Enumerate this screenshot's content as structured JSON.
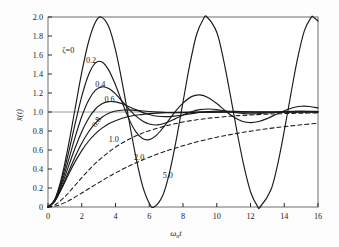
{
  "figure": {
    "background_color": "#fdfdfd",
    "curve_color": "#1a1a1a",
    "axis_color": "#2b2b2b",
    "grid_color": "#8c8c8c"
  },
  "axes": {
    "x_label_main": "ω",
    "x_label_sub": "n",
    "x_label_tail": "t",
    "y_label": "x̄(t)",
    "x_ticks": [
      "0",
      "2",
      "4",
      "6",
      "8",
      "10",
      "12",
      "14",
      "16"
    ],
    "y_ticks": [
      "0",
      "0.2",
      "0.4",
      "0.6",
      "0.8",
      "1.0",
      "1.2",
      "1.4",
      "1.6",
      "1.8",
      "2.0"
    ]
  },
  "curve_labels": {
    "zeta0": "ζ=0",
    "zeta02": "0.2",
    "zeta04": "0.4",
    "zeta06": "0.6",
    "zeta08": "0.8",
    "zeta10": "1.0",
    "zeta20": "2.0",
    "zeta50": "5.0"
  },
  "chart_data": {
    "type": "line",
    "title": "",
    "xlabel": "ωₙt",
    "ylabel": "x̄(t)",
    "xlim": [
      0,
      16
    ],
    "ylim": [
      0,
      2.0
    ],
    "xticks": [
      0,
      2,
      4,
      6,
      8,
      10,
      12,
      14,
      16
    ],
    "yticks": [
      0,
      0.2,
      0.4,
      0.6,
      0.8,
      1.0,
      1.2,
      1.4,
      1.6,
      1.8,
      2.0
    ],
    "grid": "single horizontal reference line at y = 1.0",
    "legend": "inline curve annotations (damping ratio values)",
    "series": [
      {
        "name": "ζ=0",
        "zeta": 0,
        "style": "solid",
        "label_x": 1.2,
        "label_y": 1.62,
        "peak_value": 2.0,
        "peak_x": 3.14,
        "x": [
          0,
          0.4,
          0.8,
          1.2,
          1.6,
          2.0,
          2.4,
          2.8,
          3.14,
          3.6,
          4.0,
          4.4,
          4.8,
          5.2,
          5.6,
          6.0,
          6.28,
          6.8,
          7.2,
          7.6,
          8.0,
          8.4,
          8.8,
          9.2,
          9.42,
          10.0,
          10.4,
          10.8,
          11.2,
          11.6,
          12.0,
          12.4,
          12.57,
          13.2,
          13.6,
          14.0,
          14.4,
          14.8,
          15.2,
          15.6,
          15.71,
          16.0
        ],
        "y": [
          0,
          0.079,
          0.304,
          0.638,
          1.029,
          1.416,
          1.737,
          1.942,
          2.0,
          1.897,
          1.654,
          1.307,
          0.913,
          0.532,
          0.225,
          0.04,
          0.0,
          0.122,
          0.362,
          0.706,
          1.105,
          1.495,
          1.813,
          1.977,
          2.0,
          1.839,
          1.551,
          1.183,
          0.792,
          0.44,
          0.161,
          0.012,
          0.0,
          0.176,
          0.441,
          0.801,
          1.197,
          1.572,
          1.859,
          1.996,
          2.0,
          1.958
        ]
      },
      {
        "name": "0.2",
        "zeta": 0.2,
        "style": "solid",
        "label_x": 2.55,
        "label_y": 1.52,
        "peak_value": 1.527,
        "peak_x": 3.21,
        "x": [
          0,
          0.4,
          0.8,
          1.2,
          1.6,
          2.0,
          2.4,
          2.8,
          3.2,
          3.6,
          4.0,
          4.4,
          4.8,
          5.2,
          5.6,
          6.0,
          6.4,
          6.8,
          7.2,
          7.6,
          8.0,
          8.5,
          9.0,
          9.5,
          10.0,
          10.5,
          11.0,
          11.5,
          12.0,
          12.5,
          13.0,
          13.5,
          14.0,
          14.5,
          15.0,
          15.5,
          16.0
        ],
        "y": [
          0,
          0.075,
          0.277,
          0.558,
          0.869,
          1.165,
          1.39,
          1.515,
          1.527,
          1.441,
          1.285,
          1.1,
          0.925,
          0.793,
          0.72,
          0.709,
          0.751,
          0.83,
          0.925,
          1.018,
          1.094,
          1.162,
          1.18,
          1.151,
          1.089,
          1.014,
          0.947,
          0.903,
          0.888,
          0.9,
          0.932,
          0.973,
          1.014,
          1.045,
          1.06,
          1.058,
          1.043
        ]
      },
      {
        "name": "0.4",
        "zeta": 0.4,
        "style": "solid",
        "label_x": 3.1,
        "label_y": 1.26,
        "peak_value": 1.254,
        "peak_x": 3.43,
        "x": [
          0,
          0.4,
          0.8,
          1.2,
          1.6,
          2.0,
          2.4,
          2.8,
          3.2,
          3.6,
          4.0,
          4.4,
          4.8,
          5.2,
          5.6,
          6.0,
          6.5,
          7.0,
          7.5,
          8.0,
          8.5,
          9.0,
          9.5,
          10.0,
          11.0,
          12.0,
          13.0,
          14.0,
          15.0,
          16.0
        ],
        "y": [
          0,
          0.071,
          0.25,
          0.484,
          0.73,
          0.952,
          1.122,
          1.228,
          1.265,
          1.247,
          1.19,
          1.112,
          1.031,
          0.959,
          0.906,
          0.874,
          0.864,
          0.886,
          0.925,
          0.968,
          1.003,
          1.025,
          1.032,
          1.026,
          0.995,
          0.98,
          0.99,
          1.005,
          1.009,
          1.005
        ]
      },
      {
        "name": "0.6",
        "zeta": 0.6,
        "style": "solid",
        "label_x": 3.65,
        "label_y": 1.11,
        "peak_value": 1.095,
        "peak_x": 3.93,
        "x": [
          0,
          0.4,
          0.8,
          1.2,
          1.6,
          2.0,
          2.4,
          2.8,
          3.2,
          3.6,
          4.0,
          4.4,
          4.8,
          5.2,
          5.6,
          6.0,
          6.5,
          7.0,
          7.5,
          8.0,
          9.0,
          10.0,
          11.0,
          12.0,
          13.0,
          14.0,
          15.0,
          16.0
        ],
        "y": [
          0,
          0.066,
          0.224,
          0.42,
          0.618,
          0.793,
          0.932,
          1.029,
          1.086,
          1.109,
          1.106,
          1.086,
          1.056,
          1.025,
          0.996,
          0.974,
          0.955,
          0.951,
          0.957,
          0.969,
          0.996,
          1.009,
          1.007,
          1.0,
          0.997,
          0.998,
          1.0,
          1.001
        ]
      },
      {
        "name": "0.8",
        "zeta": 0.8,
        "style": "solid",
        "label_x": 3.0,
        "label_y": 0.88,
        "peak_value": 1.015,
        "peak_x": 5.24,
        "x": [
          0,
          0.4,
          0.8,
          1.2,
          1.6,
          2.0,
          2.4,
          2.8,
          3.2,
          3.6,
          4.0,
          4.5,
          5.0,
          5.5,
          6.0,
          6.5,
          7.0,
          8.0,
          9.0,
          10.0,
          11.0,
          12.0,
          14.0,
          16.0
        ],
        "y": [
          0,
          0.06,
          0.198,
          0.363,
          0.527,
          0.672,
          0.79,
          0.881,
          0.944,
          0.986,
          1.01,
          1.021,
          1.02,
          1.013,
          1.005,
          0.999,
          0.995,
          0.993,
          0.997,
          0.999,
          1.0,
          1.0,
          1.0,
          1.0
        ]
      },
      {
        "name": "1.0",
        "zeta": 1.0,
        "style": "solid",
        "label_x": 3.9,
        "label_y": 0.68,
        "peak_value": 1.0,
        "peak_x": null,
        "x": [
          0,
          0.4,
          0.8,
          1.2,
          1.6,
          2.0,
          2.4,
          2.8,
          3.2,
          3.6,
          4.0,
          4.5,
          5.0,
          5.5,
          6.0,
          7.0,
          8.0,
          9.0,
          10.0,
          12.0,
          14.0,
          16.0
        ],
        "y": [
          0,
          0.062,
          0.191,
          0.337,
          0.475,
          0.594,
          0.692,
          0.77,
          0.83,
          0.877,
          0.908,
          0.939,
          0.96,
          0.973,
          0.983,
          0.993,
          0.997,
          0.999,
          0.9995,
          1.0,
          1.0,
          1.0
        ]
      },
      {
        "name": "2.0",
        "zeta": 2.0,
        "style": "dashed",
        "label_x": 5.4,
        "label_y": 0.5,
        "peak_value": 1.0,
        "peak_x": null,
        "x": [
          0,
          0.5,
          1.0,
          1.5,
          2.0,
          2.5,
          3.0,
          3.5,
          4.0,
          4.5,
          5.0,
          5.5,
          6.0,
          7.0,
          8.0,
          9.0,
          10.0,
          11.0,
          12.0,
          13.0,
          14.0,
          15.0,
          16.0
        ],
        "y": [
          0,
          0.032,
          0.109,
          0.206,
          0.309,
          0.405,
          0.49,
          0.565,
          0.63,
          0.685,
          0.73,
          0.77,
          0.803,
          0.855,
          0.894,
          0.923,
          0.943,
          0.958,
          0.969,
          0.977,
          0.983,
          0.987,
          0.991
        ]
      },
      {
        "name": "5.0",
        "zeta": 5.0,
        "style": "dashed",
        "label_x": 7.1,
        "label_y": 0.31,
        "peak_value": 1.0,
        "peak_x": null,
        "x": [
          0,
          0.5,
          1.0,
          1.5,
          2.0,
          2.5,
          3.0,
          3.5,
          4.0,
          4.5,
          5.0,
          6.0,
          7.0,
          8.0,
          9.0,
          10.0,
          11.0,
          12.0,
          13.0,
          14.0,
          15.0,
          16.0
        ],
        "y": [
          0,
          0.012,
          0.046,
          0.093,
          0.147,
          0.202,
          0.256,
          0.309,
          0.358,
          0.405,
          0.448,
          0.524,
          0.589,
          0.645,
          0.693,
          0.734,
          0.769,
          0.798,
          0.824,
          0.846,
          0.865,
          0.881
        ]
      }
    ]
  }
}
